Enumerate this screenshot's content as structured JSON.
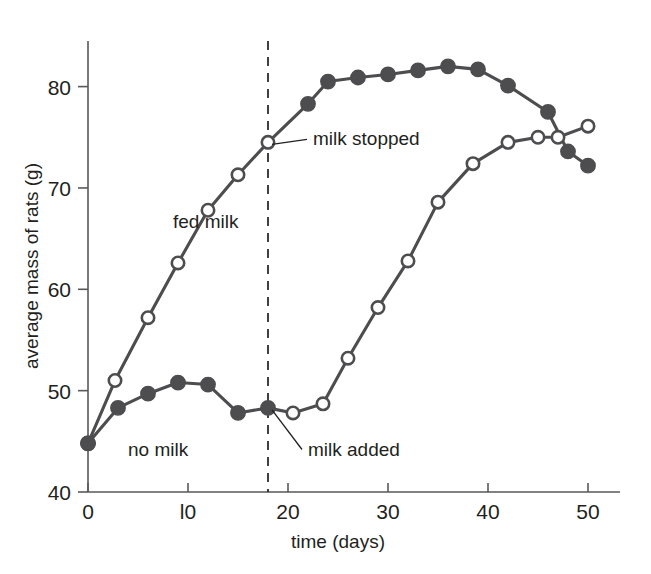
{
  "chart_data": {
    "type": "line",
    "title": "",
    "xlabel": "time (days)",
    "ylabel": "average mass of rats (g)",
    "xlim": [
      0,
      52
    ],
    "ylim": [
      40,
      84.5
    ],
    "xticks": [
      0,
      10,
      20,
      30,
      40,
      50
    ],
    "xtick_labels": [
      "0",
      "l0",
      "20",
      "30",
      "40",
      "50"
    ],
    "yticks": [
      40,
      50,
      60,
      70,
      80
    ],
    "ytick_labels": [
      "40",
      "50",
      "60",
      "70",
      "80"
    ],
    "grid": false,
    "legend": "inline-labels",
    "series": [
      {
        "name": "fed milk",
        "marker": "open-circle-then-filled",
        "label": "fed milk",
        "label_x": 8.5,
        "label_y": 66.0,
        "points": [
          {
            "x": 0,
            "y": 44.8,
            "marker": "filled"
          },
          {
            "x": 2.7,
            "y": 51.0,
            "marker": "open"
          },
          {
            "x": 6.0,
            "y": 57.2,
            "marker": "open"
          },
          {
            "x": 9.0,
            "y": 62.6,
            "marker": "open"
          },
          {
            "x": 12.0,
            "y": 67.8,
            "marker": "open"
          },
          {
            "x": 15.0,
            "y": 71.3,
            "marker": "open"
          },
          {
            "x": 18.0,
            "y": 74.5,
            "marker": "open"
          },
          {
            "x": 22.0,
            "y": 78.3,
            "marker": "filled"
          },
          {
            "x": 24.0,
            "y": 80.5,
            "marker": "filled"
          },
          {
            "x": 27.0,
            "y": 80.9,
            "marker": "filled"
          },
          {
            "x": 30.0,
            "y": 81.2,
            "marker": "filled"
          },
          {
            "x": 33.0,
            "y": 81.6,
            "marker": "filled"
          },
          {
            "x": 36.0,
            "y": 82.0,
            "marker": "filled"
          },
          {
            "x": 39.0,
            "y": 81.7,
            "marker": "filled"
          },
          {
            "x": 42.0,
            "y": 80.1,
            "marker": "filled"
          },
          {
            "x": 46.0,
            "y": 77.5,
            "marker": "filled"
          },
          {
            "x": 48.0,
            "y": 73.6,
            "marker": "filled"
          },
          {
            "x": 50.0,
            "y": 72.2,
            "marker": "filled"
          }
        ]
      },
      {
        "name": "no milk",
        "marker": "filled-circle-then-open",
        "label": "no milk",
        "label_x": 4.0,
        "label_y": 43.6,
        "points": [
          {
            "x": 0,
            "y": 44.8,
            "marker": "filled"
          },
          {
            "x": 3.0,
            "y": 48.3,
            "marker": "filled"
          },
          {
            "x": 6.0,
            "y": 49.7,
            "marker": "filled"
          },
          {
            "x": 9.0,
            "y": 50.8,
            "marker": "filled"
          },
          {
            "x": 12.0,
            "y": 50.6,
            "marker": "filled"
          },
          {
            "x": 15.0,
            "y": 47.8,
            "marker": "filled"
          },
          {
            "x": 18.0,
            "y": 48.3,
            "marker": "filled"
          },
          {
            "x": 20.5,
            "y": 47.8,
            "marker": "open"
          },
          {
            "x": 23.5,
            "y": 48.7,
            "marker": "open"
          },
          {
            "x": 26.0,
            "y": 53.2,
            "marker": "open"
          },
          {
            "x": 29.0,
            "y": 58.2,
            "marker": "open"
          },
          {
            "x": 32.0,
            "y": 62.8,
            "marker": "open"
          },
          {
            "x": 35.0,
            "y": 68.6,
            "marker": "open"
          },
          {
            "x": 38.5,
            "y": 72.4,
            "marker": "open"
          },
          {
            "x": 42.0,
            "y": 74.5,
            "marker": "open"
          },
          {
            "x": 45.0,
            "y": 75.0,
            "marker": "open"
          },
          {
            "x": 47.0,
            "y": 75.0,
            "marker": "open"
          },
          {
            "x": 50.0,
            "y": 76.1,
            "marker": "open"
          }
        ]
      }
    ],
    "event_line": {
      "x": 18,
      "style": "dashed",
      "y_top": 84.5,
      "y_bottom": 40
    },
    "annotations": [
      {
        "text": "milk stopped",
        "point_x": 18,
        "point_y": 74.5,
        "label_x": 22.5,
        "label_y": 74.2
      },
      {
        "text": "milk added",
        "point_x": 18,
        "point_y": 48.3,
        "label_x": 22.0,
        "label_y": 43.6
      }
    ],
    "colors": {
      "line": "#4d4d4f",
      "axis": "#58595b",
      "text": "#231f20",
      "marker_fill_open": "#ffffff",
      "background": "#ffffff"
    }
  }
}
